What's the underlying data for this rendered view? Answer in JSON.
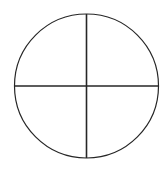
{
  "figure": {
    "title": "Circle divided into four quadrants by vertical and horizontal diameters",
    "canvas": {
      "width": 168,
      "height": 170,
      "background_color": "#ffffff"
    },
    "stroke_color": "#262626",
    "fill_color": "none",
    "circle": {
      "name": "circle-outline",
      "center_x": 86.5,
      "center_y": 86,
      "radius": 72,
      "stroke_width": 1.2
    },
    "vertical_diameter": {
      "name": "vertical-diameter-line",
      "x1": 86.5,
      "y1": 14,
      "x2": 86.5,
      "y2": 158,
      "stroke_width": 1.6
    },
    "horizontal_diameter": {
      "name": "horizontal-diameter-line",
      "x1": 14.5,
      "y1": 86,
      "x2": 158.5,
      "y2": 86,
      "stroke_width": 1.6
    }
  }
}
